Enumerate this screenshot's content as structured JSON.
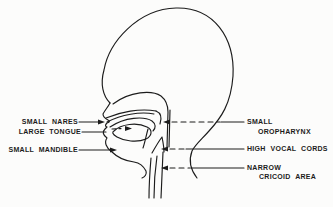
{
  "figure": {
    "type": "anatomical-line-diagram",
    "labels_left": [
      {
        "text": "SMALL NARES"
      },
      {
        "text": "LARGE TONGUE"
      },
      {
        "text": "SMALL MANDIBLE"
      }
    ],
    "labels_right": [
      {
        "line1": "SMALL",
        "line2": "OROPHARYNX"
      },
      {
        "line1": "HIGH VOCAL CORDS",
        "line2": ""
      },
      {
        "line1": "NARROW",
        "line2": "CRICOID AREA"
      }
    ],
    "colors": {
      "ink": "#1c1c1c",
      "paper": "#fcfcfb"
    }
  }
}
